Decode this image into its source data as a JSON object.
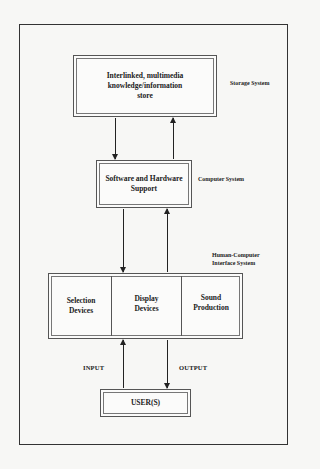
{
  "diagram": {
    "type": "layered-system-architecture",
    "nodes": [
      {
        "id": "storage",
        "label": "Interlinked, multimedia knowledge/information store",
        "lines": [
          "Interlinked, multimedia",
          "knowledge/information",
          "store"
        ],
        "layer_label": "Storage System"
      },
      {
        "id": "software",
        "label": "Software and Hardware Support",
        "lines": [
          "Software and Hardware",
          "Support"
        ],
        "layer_label": "Computer System"
      },
      {
        "id": "hci",
        "label": "Human-Computer Interface System",
        "layer_label_lines": [
          "Human-Computer",
          "Interface System"
        ],
        "cells": [
          {
            "label": "Selection Devices",
            "lines": [
              "Selection",
              "Devices"
            ]
          },
          {
            "label": "Display Devices",
            "lines": [
              "Display",
              "Devices"
            ]
          },
          {
            "label": "Sound Production",
            "lines": [
              "Sound",
              "Production"
            ]
          }
        ]
      },
      {
        "id": "user",
        "label": "USER(S)"
      }
    ],
    "edges": [
      {
        "from": "storage",
        "to": "software"
      },
      {
        "from": "software",
        "to": "storage"
      },
      {
        "from": "software",
        "to": "hci"
      },
      {
        "from": "hci",
        "to": "software"
      },
      {
        "from": "user",
        "to": "hci",
        "label": "INPUT"
      },
      {
        "from": "hci",
        "to": "user",
        "label": "OUTPUT"
      }
    ],
    "flow_labels": {
      "input": "INPUT",
      "output": "OUTPUT"
    }
  },
  "labels": {
    "storage_l1": "Interlinked, multimedia",
    "storage_l2": "knowledge/information",
    "storage_l3": "store",
    "software_l1": "Software and Hardware",
    "software_l2": "Support",
    "hci_c1_l1": "Selection",
    "hci_c1_l2": "Devices",
    "hci_c2_l1": "Display",
    "hci_c2_l2": "Devices",
    "hci_c3_l1": "Sound",
    "hci_c3_l2": "Production",
    "user": "USER(S)",
    "storage_system": "Storage System",
    "computer_system": "Computer System",
    "hci_system_l1": "Human-Computer",
    "hci_system_l2": "Interface System",
    "input": "INPUT",
    "output": "OUTPUT"
  }
}
